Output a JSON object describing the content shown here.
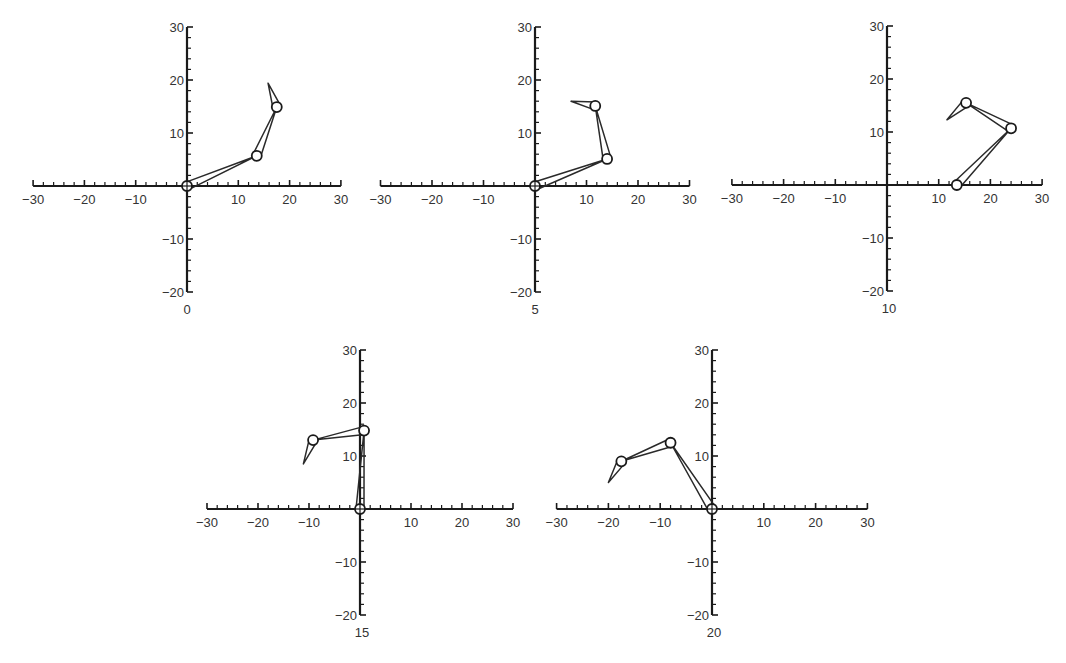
{
  "chart_data": [
    {
      "type": "line",
      "title": "",
      "frame_label": "0",
      "xlabel": "",
      "ylabel": "",
      "xlim": [
        -30,
        30
      ],
      "ylim": [
        -20,
        30
      ],
      "xticks": [
        -30,
        -20,
        -10,
        10,
        20,
        30
      ],
      "yticks": [
        30,
        20,
        10,
        -10,
        -20
      ],
      "grid": false,
      "series": [
        {
          "name": "linkage",
          "joints": [
            [
              0,
              0
            ],
            [
              13.6,
              5.7
            ],
            [
              17.5,
              14.9
            ]
          ],
          "tip": [
            15.8,
            19.4
          ]
        }
      ]
    },
    {
      "type": "line",
      "title": "",
      "frame_label": "5",
      "xlabel": "",
      "ylabel": "",
      "xlim": [
        -30,
        30
      ],
      "ylim": [
        -20,
        30
      ],
      "xticks": [
        -30,
        -20,
        -10,
        10,
        20,
        30
      ],
      "yticks": [
        30,
        20,
        10,
        -10,
        -20
      ],
      "grid": false,
      "series": [
        {
          "name": "linkage",
          "joints": [
            [
              0,
              0
            ],
            [
              14.0,
              5.1
            ],
            [
              11.7,
              15.1
            ]
          ],
          "tip": [
            7.0,
            16.0
          ]
        }
      ]
    },
    {
      "type": "line",
      "title": "",
      "frame_label": "10",
      "xlabel": "",
      "ylabel": "",
      "xlim": [
        -30,
        30
      ],
      "ylim": [
        -20,
        30
      ],
      "xticks": [
        -30,
        -20,
        -10,
        10,
        20,
        30
      ],
      "yticks": [
        30,
        20,
        10,
        -10,
        -20
      ],
      "grid": false,
      "series": [
        {
          "name": "linkage",
          "joints": [
            [
              13.5,
              0
            ],
            [
              24.0,
              10.7
            ],
            [
              15.3,
              15.5
            ]
          ],
          "tip": [
            11.6,
            12.3
          ]
        }
      ]
    },
    {
      "type": "line",
      "title": "",
      "frame_label": "15",
      "xlabel": "",
      "ylabel": "",
      "xlim": [
        -30,
        30
      ],
      "ylim": [
        -20,
        30
      ],
      "xticks": [
        -30,
        -20,
        -10,
        10,
        20,
        30
      ],
      "yticks": [
        30,
        20,
        10,
        -10,
        -20
      ],
      "grid": false,
      "series": [
        {
          "name": "linkage",
          "joints": [
            [
              0,
              0
            ],
            [
              0.8,
              14.8
            ],
            [
              -9.2,
              13.0
            ]
          ],
          "tip": [
            -11.1,
            8.5
          ]
        }
      ]
    },
    {
      "type": "line",
      "title": "",
      "frame_label": "20",
      "xlabel": "",
      "ylabel": "",
      "xlim": [
        -30,
        30
      ],
      "ylim": [
        -20,
        30
      ],
      "xticks": [
        -30,
        -20,
        -10,
        10,
        20,
        30
      ],
      "yticks": [
        30,
        20,
        10,
        -10,
        -20
      ],
      "grid": false,
      "series": [
        {
          "name": "linkage",
          "joints": [
            [
              0,
              0
            ],
            [
              -8.0,
              12.5
            ],
            [
              -17.5,
              9.0
            ]
          ],
          "tip": [
            -20.0,
            5.0
          ]
        }
      ]
    }
  ],
  "layout": {
    "panels": [
      {
        "ox": 187,
        "oy": 186,
        "sx": 5.13,
        "sy": 5.3
      },
      {
        "ox": 535,
        "oy": 186,
        "sx": 5.15,
        "sy": 5.3
      },
      {
        "ox": 887,
        "oy": 185,
        "sx": 5.17,
        "sy": 5.3
      },
      {
        "ox": 360,
        "oy": 509,
        "sx": 5.1,
        "sy": 5.3
      },
      {
        "ox": 712,
        "oy": 509,
        "sx": 5.18,
        "sy": 5.3
      }
    ]
  }
}
